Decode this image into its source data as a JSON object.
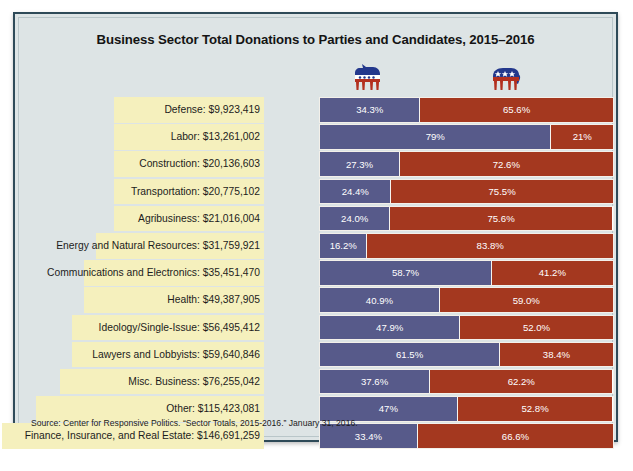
{
  "title": "Business Sector Total Donations to Parties and Candidates, 2015–2016",
  "source": "Source: Center for Responsive Politics. “Sector Totals, 2015-2016.” January 31, 2016.",
  "legend": [
    {
      "name": "democratic-party-donkey",
      "icon": "donkey-icon",
      "color": "#575a8a"
    },
    {
      "name": "republican-party-elephant",
      "icon": "elephant-icon",
      "color": "#a4381f"
    }
  ],
  "colors": {
    "democrat": "#575a8a",
    "republican": "#a4381f",
    "panel_background": "#dde4e5",
    "label_plate": "#f5f0bd",
    "frame_border": "#2e4a58",
    "title_text": "#141414"
  },
  "chart_data": {
    "type": "bar",
    "subtype": "horizontal-stacked-100-percent",
    "title": "Business Sector Total Donations to Parties and Candidates, 2015–2016",
    "xlabel": "",
    "ylabel": "",
    "xlim": [
      0,
      100
    ],
    "grid": false,
    "legend_position": "top",
    "series": [
      {
        "name": "Democratic",
        "color": "#575a8a",
        "values": [
          34.3,
          79,
          27.3,
          24.4,
          24.0,
          16.2,
          58.7,
          40.9,
          47.9,
          61.5,
          37.6,
          47,
          33.4
        ]
      },
      {
        "name": "Republican",
        "color": "#a4381f",
        "values": [
          65.6,
          21,
          72.6,
          75.5,
          75.6,
          83.8,
          41.2,
          59.0,
          52.0,
          38.4,
          62.2,
          52.8,
          66.6
        ]
      }
    ],
    "categories": [
      "Defense",
      "Labor",
      "Construction",
      "Transportation",
      "Agribusiness",
      "Energy and Natural Resources",
      "Communications and Electronics",
      "Health",
      "Ideology/Single-Issue",
      "Lawyers and Lobbyists",
      "Misc. Business",
      "Other",
      "Finance, Insurance, and Real Estate"
    ],
    "totals": [
      "$9,923,419",
      "$13,261,002",
      "$20,136,603",
      "$20,775,102",
      "$21,016,004",
      "$31,759,921",
      "$35,451,470",
      "$49,387,905",
      "$56,495,412",
      "$59,640,846",
      "$76,255,042",
      "$115,423,081",
      "$146,691,259"
    ],
    "rows": [
      {
        "label": "Defense: $9,923,419",
        "dem": 34.3,
        "rep": 65.6,
        "dem_label": "34.3%",
        "rep_label": "65.6%",
        "plate_width": 150
      },
      {
        "label": "Labor: $13,261,002",
        "dem": 79,
        "rep": 21,
        "dem_label": "79%",
        "rep_label": "21%",
        "plate_width": 150
      },
      {
        "label": "Construction: $20,136,603",
        "dem": 27.3,
        "rep": 72.6,
        "dem_label": "27.3%",
        "rep_label": "72.6%",
        "plate_width": 150
      },
      {
        "label": "Transportation: $20,775,102",
        "dem": 24.4,
        "rep": 75.5,
        "dem_label": "24.4%",
        "rep_label": "75.5%",
        "plate_width": 150
      },
      {
        "label": "Agribusiness: $21,016,004",
        "dem": 24.0,
        "rep": 75.6,
        "dem_label": "24.0%",
        "rep_label": "75.6%",
        "plate_width": 150
      },
      {
        "label": "Energy and Natural Resources: $31,759,921",
        "dem": 16.2,
        "rep": 83.8,
        "dem_label": "16.2%",
        "rep_label": "83.8%",
        "plate_width": 168
      },
      {
        "label": "Communications and Electronics: $35,451,470",
        "dem": 58.7,
        "rep": 41.2,
        "dem_label": "58.7%",
        "rep_label": "41.2%",
        "plate_width": 180
      },
      {
        "label": "Health: $49,387,905",
        "dem": 40.9,
        "rep": 59.0,
        "dem_label": "40.9%",
        "rep_label": "59.0%",
        "plate_width": 180
      },
      {
        "label": "Ideology/Single-Issue: $56,495,412",
        "dem": 47.9,
        "rep": 52.0,
        "dem_label": "47.9%",
        "rep_label": "52.0%",
        "plate_width": 192
      },
      {
        "label": "Lawyers and Lobbyists: $59,640,846",
        "dem": 61.5,
        "rep": 38.4,
        "dem_label": "61.5%",
        "rep_label": "38.4%",
        "plate_width": 192
      },
      {
        "label": "Misc. Business: $76,255,042",
        "dem": 37.6,
        "rep": 62.2,
        "dem_label": "37.6%",
        "rep_label": "62.2%",
        "plate_width": 204
      },
      {
        "label": "Other: $115,423,081",
        "dem": 47,
        "rep": 52.8,
        "dem_label": "47%",
        "rep_label": "52.8%",
        "plate_width": 228
      },
      {
        "label": "Finance, Insurance, and Real Estate: $146,691,259",
        "dem": 33.4,
        "rep": 66.6,
        "dem_label": "33.4%",
        "rep_label": "66.6%",
        "plate_width": 262
      }
    ]
  }
}
